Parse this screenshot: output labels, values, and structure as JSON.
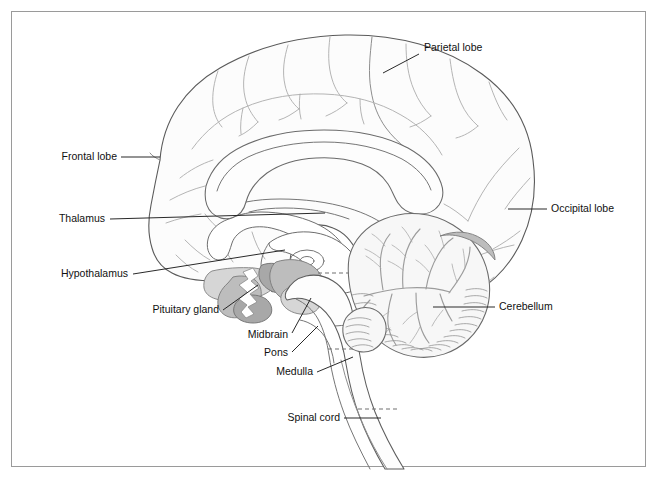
{
  "figure": {
    "background_color": "#ffffff",
    "frame_color": "#9a9a9a",
    "label_color": "#111111",
    "leader_color": "#1d1d1d"
  },
  "labels": {
    "parietal_lobe": "Parietal lobe",
    "frontal_lobe": "Frontal lobe",
    "occipital_lobe": "Occipital lobe",
    "thalamus": "Thalamus",
    "hypothalamus": "Hypothalamus",
    "pituitary_gland": "Pituitary gland",
    "midbrain": "Midbrain",
    "pons": "Pons",
    "medulla": "Medulla",
    "spinal_cord": "Spinal cord",
    "cerebellum": "Cerebellum"
  },
  "structures": [
    {
      "name": "Parietal lobe",
      "side": "right",
      "label_x": 424,
      "label_y": 51
    },
    {
      "name": "Frontal lobe",
      "side": "left",
      "label_x": 117,
      "label_y": 160
    },
    {
      "name": "Occipital lobe",
      "side": "right",
      "label_x": 551,
      "label_y": 212
    },
    {
      "name": "Thalamus",
      "side": "left",
      "label_x": 105,
      "label_y": 222
    },
    {
      "name": "Hypothalamus",
      "side": "left",
      "label_x": 128,
      "label_y": 277
    },
    {
      "name": "Pituitary gland",
      "side": "left",
      "label_x": 219,
      "label_y": 313
    },
    {
      "name": "Midbrain",
      "side": "left",
      "label_x": 288,
      "label_y": 338
    },
    {
      "name": "Pons",
      "side": "left",
      "label_x": 288,
      "label_y": 356
    },
    {
      "name": "Medulla",
      "side": "left",
      "label_x": 313,
      "label_y": 375
    },
    {
      "name": "Spinal cord",
      "side": "left",
      "label_x": 340,
      "label_y": 421
    },
    {
      "name": "Cerebellum",
      "side": "right",
      "label_x": 499,
      "label_y": 310
    }
  ],
  "palette": {
    "outline_stroke": "#5a5a5a",
    "sulcus_stroke": "#b0b0b0",
    "shade_mid": "#bdbdbd",
    "shade_light": "#d6d6d6",
    "shade_dark": "#a8a8a8",
    "cerebellum_grey": "#c9c9c9"
  }
}
